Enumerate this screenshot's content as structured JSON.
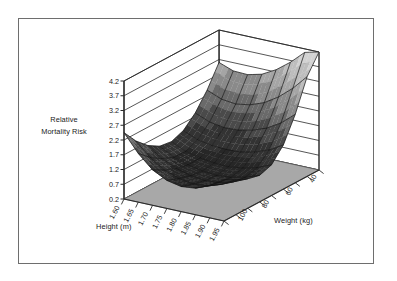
{
  "figure": {
    "background_color": "#ffffff",
    "frame_color": "#6e6e6e"
  },
  "chart_data": {
    "type": "surface",
    "title": "",
    "subtitle": "",
    "zlabel_line1": "Relative",
    "zlabel_line2": "Mortality Risk",
    "xlabel": "Height (m)",
    "ylabel": "Weight (kg)",
    "zlabel": "Relative Mortality Risk",
    "grid": true,
    "legend": "none",
    "x_name": "Height (m)",
    "x_ticks": [
      "1.60",
      "1.65",
      "1.70",
      "1.75",
      "1.80",
      "1.85",
      "1.90",
      "1.95"
    ],
    "x_values": [
      1.6,
      1.65,
      1.7,
      1.75,
      1.8,
      1.85,
      1.9,
      1.95
    ],
    "xlim": [
      1.6,
      1.95
    ],
    "y_name": "Weight (kg)",
    "y_ticks": [
      "100",
      "80",
      "60",
      "40"
    ],
    "y_tick_values": [
      100,
      80,
      60,
      40
    ],
    "y_values": [
      110,
      100,
      90,
      80,
      70,
      60,
      50,
      40,
      30
    ],
    "ylim": [
      110,
      30
    ],
    "z_name": "Relative Mortality Risk",
    "z_ticks": [
      "4.2",
      "3.7",
      "3.2",
      "2.7",
      "2.2",
      "1.7",
      "1.2",
      "0.7",
      "0.2"
    ],
    "z_tick_values": [
      4.2,
      3.7,
      3.2,
      2.7,
      2.2,
      1.7,
      1.2,
      0.7,
      0.2
    ],
    "zlim": [
      0.2,
      4.2
    ],
    "surface_colormap": [
      "#1e1e1e",
      "#272727",
      "#333333",
      "#4a4a4a",
      "#6a6a6a",
      "#8a8a8a",
      "#a5a5a5",
      "#bdbdbd",
      "#d2d2d2"
    ],
    "floor_color": "#a8a8a8",
    "mesh_color": "#111111",
    "z_matrix": [
      [
        2.45,
        1.85,
        1.4,
        1.15,
        1.05,
        1.1,
        1.3,
        1.6
      ],
      [
        1.95,
        1.5,
        1.18,
        1.0,
        0.92,
        0.96,
        1.12,
        1.38
      ],
      [
        1.58,
        1.24,
        1.02,
        0.88,
        0.82,
        0.86,
        0.99,
        1.2
      ],
      [
        1.34,
        1.08,
        0.92,
        0.82,
        0.78,
        0.82,
        0.93,
        1.1
      ],
      [
        1.28,
        1.06,
        0.94,
        0.88,
        0.86,
        0.92,
        1.04,
        1.24
      ],
      [
        1.44,
        1.24,
        1.14,
        1.12,
        1.14,
        1.24,
        1.42,
        1.7
      ],
      [
        1.82,
        1.62,
        1.54,
        1.56,
        1.66,
        1.84,
        2.12,
        2.52
      ],
      [
        2.38,
        2.18,
        2.12,
        2.2,
        2.38,
        2.68,
        3.08,
        3.58
      ],
      [
        3.1,
        2.92,
        2.9,
        3.02,
        3.28,
        3.64,
        4.08,
        4.2
      ]
    ],
    "z_matrix_rows_axis": "Weight (kg) from 110 (front-left) to 30 (back-right)",
    "z_matrix_cols_axis": "Height (m) from 1.60 to 1.95",
    "annotation": "U-shaped relative mortality risk surface; minimum risk in mid weight / mid-tall region, rising steeply at low weight and low height."
  }
}
